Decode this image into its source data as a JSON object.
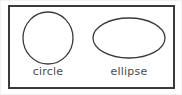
{
  "figure": {
    "name": "circle-and-ellipse-figure",
    "background_color": "#ffffff",
    "frame": {
      "stroke_color": "#3a3a3a",
      "stroke_width": 2,
      "fill_color": "#ffffff"
    },
    "shapes": [
      {
        "id": "circle",
        "kind": "circle",
        "label": "circle",
        "stroke_color": "#3a3a3a",
        "stroke_width": 1.3,
        "fill": "none",
        "center_x": 48,
        "center_y": 38,
        "radius_x": 25,
        "radius_y": 26
      },
      {
        "id": "ellipse",
        "kind": "ellipse",
        "label": "ellipse",
        "stroke_color": "#3a3a3a",
        "stroke_width": 1.3,
        "fill": "none",
        "center_x": 129,
        "center_y": 38,
        "radius_x": 36,
        "radius_y": 20
      }
    ],
    "label_color": "#4a4a4a"
  }
}
